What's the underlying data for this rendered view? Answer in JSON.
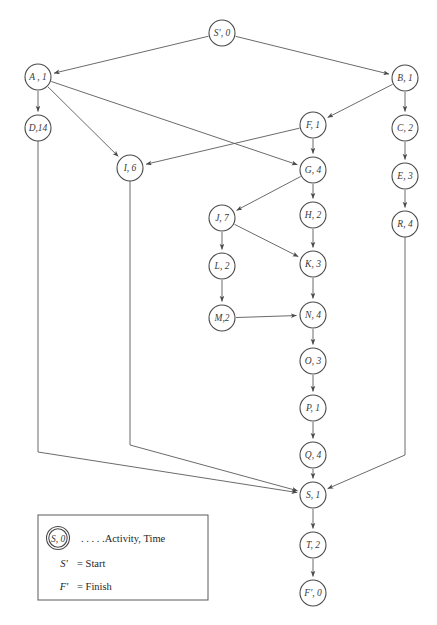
{
  "diagram": {
    "type": "activity-on-node-network",
    "nodes": [
      {
        "id": "Sp",
        "label": "S', 0",
        "activity": "S'",
        "time": 0,
        "x": 222,
        "y": 33,
        "r": 13
      },
      {
        "id": "A",
        "label": "A , 1",
        "activity": "A",
        "time": 1,
        "x": 38,
        "y": 77,
        "r": 13
      },
      {
        "id": "B",
        "label": "B, 1",
        "activity": "B",
        "time": 1,
        "x": 405,
        "y": 78,
        "r": 13
      },
      {
        "id": "D",
        "label": "D,14",
        "activity": "D",
        "time": 14,
        "x": 38,
        "y": 128,
        "r": 13
      },
      {
        "id": "F",
        "label": "F, 1",
        "activity": "F",
        "time": 1,
        "x": 313,
        "y": 125,
        "r": 13
      },
      {
        "id": "C",
        "label": "C, 2",
        "activity": "C",
        "time": 2,
        "x": 405,
        "y": 128,
        "r": 13
      },
      {
        "id": "I",
        "label": "I, 6",
        "activity": "I",
        "time": 6,
        "x": 130,
        "y": 168,
        "r": 13
      },
      {
        "id": "G",
        "label": "G, 4",
        "activity": "G",
        "time": 4,
        "x": 313,
        "y": 170,
        "r": 13
      },
      {
        "id": "E",
        "label": "E, 3",
        "activity": "E",
        "time": 3,
        "x": 405,
        "y": 176,
        "r": 13
      },
      {
        "id": "J",
        "label": "J, 7",
        "activity": "J",
        "time": 7,
        "x": 222,
        "y": 218,
        "r": 13
      },
      {
        "id": "H",
        "label": "H, 2",
        "activity": "H",
        "time": 2,
        "x": 313,
        "y": 215,
        "r": 13
      },
      {
        "id": "R",
        "label": "R, 4",
        "activity": "R",
        "time": 4,
        "x": 405,
        "y": 224,
        "r": 13
      },
      {
        "id": "L",
        "label": "L, 2",
        "activity": "L",
        "time": 2,
        "x": 222,
        "y": 266,
        "r": 13
      },
      {
        "id": "K",
        "label": "K, 3",
        "activity": "K",
        "time": 3,
        "x": 313,
        "y": 264,
        "r": 13
      },
      {
        "id": "M",
        "label": "M,2",
        "activity": "M",
        "time": 2,
        "x": 222,
        "y": 318,
        "r": 13
      },
      {
        "id": "N",
        "label": "N, 4",
        "activity": "N",
        "time": 4,
        "x": 313,
        "y": 315,
        "r": 13
      },
      {
        "id": "O",
        "label": "O, 3",
        "activity": "O",
        "time": 3,
        "x": 313,
        "y": 361,
        "r": 13
      },
      {
        "id": "P",
        "label": "P, 1",
        "activity": "P",
        "time": 1,
        "x": 313,
        "y": 408,
        "r": 13
      },
      {
        "id": "Q",
        "label": "Q, 4",
        "activity": "Q",
        "time": 4,
        "x": 313,
        "y": 455,
        "r": 13
      },
      {
        "id": "S",
        "label": "S, 1",
        "activity": "S",
        "time": 1,
        "x": 313,
        "y": 495,
        "r": 13
      },
      {
        "id": "T",
        "label": "T, 2",
        "activity": "T",
        "time": 2,
        "x": 313,
        "y": 545,
        "r": 13
      },
      {
        "id": "Fp",
        "label": "F', 0",
        "activity": "F'",
        "time": 0,
        "x": 313,
        "y": 593,
        "r": 13
      }
    ],
    "edges": [
      {
        "from": "Sp",
        "to": "A"
      },
      {
        "from": "Sp",
        "to": "B"
      },
      {
        "from": "A",
        "to": "D"
      },
      {
        "from": "A",
        "to": "I"
      },
      {
        "from": "A",
        "to": "G"
      },
      {
        "from": "B",
        "to": "C"
      },
      {
        "from": "B",
        "to": "F"
      },
      {
        "from": "C",
        "to": "E"
      },
      {
        "from": "E",
        "to": "R"
      },
      {
        "from": "F",
        "to": "I"
      },
      {
        "from": "F",
        "to": "G"
      },
      {
        "from": "G",
        "to": "J"
      },
      {
        "from": "G",
        "to": "H"
      },
      {
        "from": "H",
        "to": "K"
      },
      {
        "from": "J",
        "to": "L"
      },
      {
        "from": "J",
        "to": "K"
      },
      {
        "from": "L",
        "to": "M"
      },
      {
        "from": "K",
        "to": "N"
      },
      {
        "from": "M",
        "to": "N"
      },
      {
        "from": "N",
        "to": "O"
      },
      {
        "from": "O",
        "to": "P"
      },
      {
        "from": "P",
        "to": "Q"
      },
      {
        "from": "Q",
        "to": "S"
      },
      {
        "from": "D",
        "to": "S"
      },
      {
        "from": "I",
        "to": "S"
      },
      {
        "from": "R",
        "to": "S"
      },
      {
        "from": "S",
        "to": "T"
      },
      {
        "from": "T",
        "to": "Fp"
      }
    ]
  },
  "legend": {
    "sample_node_label": "S, 0",
    "sample_caption": ". . . . .Activity, Time",
    "start_symbol": "S'",
    "start_text": "= Start",
    "finish_symbol": "F'",
    "finish_text": "= Finish"
  },
  "colors": {
    "stroke": "#5a5a5a",
    "node_stroke": "#4a4a4a",
    "text": "#3a3a3a",
    "background": "#ffffff"
  }
}
